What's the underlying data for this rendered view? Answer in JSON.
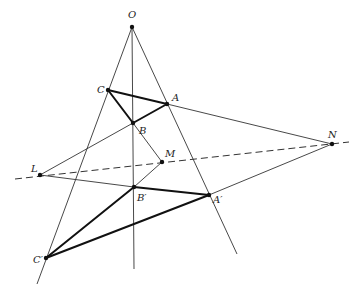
{
  "diagram": {
    "colors": {
      "background": "#ffffff",
      "line": "#333333",
      "thick_line": "#111111",
      "point": "#111111"
    },
    "points": [
      {
        "id": "O",
        "label": "O",
        "x": 132,
        "y": 27,
        "lx": 128,
        "ly": 18
      },
      {
        "id": "C",
        "label": "C",
        "x": 108,
        "y": 90,
        "lx": 97,
        "ly": 93
      },
      {
        "id": "A",
        "label": "A",
        "x": 167,
        "y": 104,
        "lx": 172,
        "ly": 101
      },
      {
        "id": "B",
        "label": "B",
        "x": 133,
        "y": 123,
        "lx": 139,
        "ly": 134
      },
      {
        "id": "L",
        "label": "L",
        "x": 40,
        "y": 175,
        "lx": 31,
        "ly": 172
      },
      {
        "id": "M",
        "label": "M",
        "x": 162,
        "y": 162,
        "lx": 165,
        "ly": 157
      },
      {
        "id": "N",
        "label": "N",
        "x": 332,
        "y": 144,
        "lx": 328,
        "ly": 138
      },
      {
        "id": "Bp",
        "label": "B′",
        "x": 134,
        "y": 187,
        "lx": 137,
        "ly": 201
      },
      {
        "id": "Ap",
        "label": "A′",
        "x": 209,
        "y": 195,
        "lx": 213,
        "ly": 203
      },
      {
        "id": "Cp",
        "label": "C′",
        "x": 46,
        "y": 258,
        "lx": 33,
        "ly": 263
      }
    ],
    "thin_lines": [
      {
        "name": "line-O-C-Cp",
        "x1": 132,
        "y1": 27,
        "x2": 37,
        "y2": 284
      },
      {
        "name": "line-O-B-Bp",
        "x1": 132,
        "y1": 27,
        "x2": 134,
        "y2": 269
      },
      {
        "name": "line-O-A-Ap",
        "x1": 132,
        "y1": 27,
        "x2": 237,
        "y2": 254
      },
      {
        "name": "line-L-B",
        "x1": 40,
        "y1": 175,
        "x2": 133,
        "y2": 123
      },
      {
        "name": "line-L-Bp",
        "x1": 40,
        "y1": 175,
        "x2": 134,
        "y2": 187
      },
      {
        "name": "line-B-M",
        "x1": 133,
        "y1": 123,
        "x2": 162,
        "y2": 162
      },
      {
        "name": "line-Bp-M",
        "x1": 134,
        "y1": 187,
        "x2": 162,
        "y2": 162
      },
      {
        "name": "line-A-N",
        "x1": 167,
        "y1": 104,
        "x2": 332,
        "y2": 144
      },
      {
        "name": "line-Ap-N",
        "x1": 209,
        "y1": 195,
        "x2": 332,
        "y2": 144
      }
    ],
    "thick_lines": [
      {
        "name": "side-C-A",
        "x1": 108,
        "y1": 90,
        "x2": 167,
        "y2": 104
      },
      {
        "name": "side-A-B",
        "x1": 167,
        "y1": 104,
        "x2": 133,
        "y2": 123
      },
      {
        "name": "side-B-C",
        "x1": 133,
        "y1": 123,
        "x2": 108,
        "y2": 90
      },
      {
        "name": "side-Cp-Bp",
        "x1": 46,
        "y1": 258,
        "x2": 134,
        "y2": 187
      },
      {
        "name": "side-Bp-Ap",
        "x1": 134,
        "y1": 187,
        "x2": 209,
        "y2": 195
      },
      {
        "name": "side-Ap-Cp",
        "x1": 209,
        "y1": 195,
        "x2": 46,
        "y2": 258
      }
    ],
    "dashed_line": {
      "name": "axis-L-M-N",
      "x1": 15,
      "y1": 179,
      "x2": 349,
      "y2": 142
    }
  }
}
